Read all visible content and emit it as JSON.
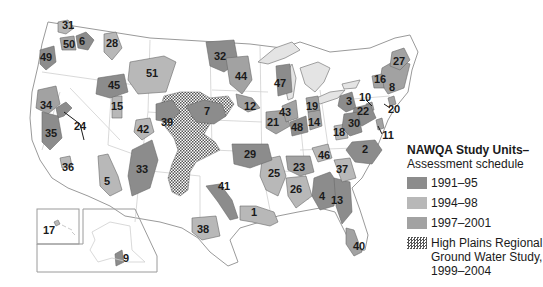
{
  "legend": {
    "title": "NAWQA Study Units–",
    "subtitle": "Assessment schedule",
    "items": [
      {
        "key": "c1991",
        "label": "1991–95",
        "color": "#8c8c8c",
        "pattern": false
      },
      {
        "key": "c1994",
        "label": "1994–98",
        "color": "#b8b8b8",
        "pattern": false
      },
      {
        "key": "c1997",
        "label": "1997–2001",
        "color": "#a2a2a2",
        "pattern": false
      },
      {
        "key": "hp",
        "label": "High Plains Regional Ground Water Study, 1999–2004",
        "color": "#9a9a9a",
        "pattern": true
      }
    ]
  },
  "units": [
    {
      "id": "1",
      "schedule": "c1994"
    },
    {
      "id": "2",
      "schedule": "c1991"
    },
    {
      "id": "3",
      "schedule": "c1991"
    },
    {
      "id": "4",
      "schedule": "c1991"
    },
    {
      "id": "5",
      "schedule": "c1994"
    },
    {
      "id": "6",
      "schedule": "c1991"
    },
    {
      "id": "7",
      "schedule": "c1991"
    },
    {
      "id": "8",
      "schedule": "c1997"
    },
    {
      "id": "9",
      "schedule": "c1991"
    },
    {
      "id": "10",
      "schedule": "c1997"
    },
    {
      "id": "11",
      "schedule": "c1997"
    },
    {
      "id": "12",
      "schedule": "c1997"
    },
    {
      "id": "13",
      "schedule": "c1991"
    },
    {
      "id": "14",
      "schedule": "c1997"
    },
    {
      "id": "15",
      "schedule": "c1994"
    },
    {
      "id": "16",
      "schedule": "c1997"
    },
    {
      "id": "17",
      "schedule": "c1994"
    },
    {
      "id": "18",
      "schedule": "c1994"
    },
    {
      "id": "19",
      "schedule": "c1997"
    },
    {
      "id": "20",
      "schedule": "c1997"
    },
    {
      "id": "21",
      "schedule": "c1997"
    },
    {
      "id": "22",
      "schedule": "c1991"
    },
    {
      "id": "23",
      "schedule": "c1997"
    },
    {
      "id": "24",
      "schedule": "c1991"
    },
    {
      "id": "25",
      "schedule": "c1994"
    },
    {
      "id": "26",
      "schedule": "c1994"
    },
    {
      "id": "27",
      "schedule": "c1997"
    },
    {
      "id": "28",
      "schedule": "c1994"
    },
    {
      "id": "29",
      "schedule": "c1991"
    },
    {
      "id": "30",
      "schedule": "c1991"
    },
    {
      "id": "31",
      "schedule": "c1994"
    },
    {
      "id": "32",
      "schedule": "c1991"
    },
    {
      "id": "33",
      "schedule": "c1991"
    },
    {
      "id": "34",
      "schedule": "c1997"
    },
    {
      "id": "35",
      "schedule": "c1991"
    },
    {
      "id": "36",
      "schedule": "c1994"
    },
    {
      "id": "37",
      "schedule": "c1994"
    },
    {
      "id": "38",
      "schedule": "c1994"
    },
    {
      "id": "39",
      "schedule": "c1991"
    },
    {
      "id": "40",
      "schedule": "c1997"
    },
    {
      "id": "41",
      "schedule": "c1991"
    },
    {
      "id": "42",
      "schedule": "c1994"
    },
    {
      "id": "43",
      "schedule": "c1997"
    },
    {
      "id": "44",
      "schedule": "c1997"
    },
    {
      "id": "45",
      "schedule": "c1991"
    },
    {
      "id": "46",
      "schedule": "c1994"
    },
    {
      "id": "47",
      "schedule": "c1991"
    },
    {
      "id": "48",
      "schedule": "c1991"
    },
    {
      "id": "49",
      "schedule": "c1991"
    },
    {
      "id": "50",
      "schedule": "c1997"
    },
    {
      "id": "51",
      "schedule": "c1994"
    }
  ]
}
